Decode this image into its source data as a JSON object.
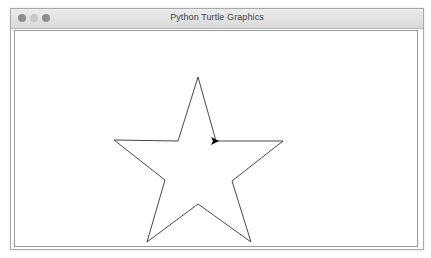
{
  "window": {
    "title": "Python Turtle Graphics",
    "controls": [
      "close",
      "minimize",
      "maximize"
    ]
  },
  "canvas": {
    "background": "#ffffff",
    "shape": "five-pointed star",
    "stroke_color": "#333333",
    "star_points": "198,77 216,141 283,141 232,181 251,242 198,204 147,242 165,180 114,140 178,141",
    "turtle": {
      "icon": "turtle-arrow-icon",
      "x": 216,
      "y": 141,
      "heading": "right",
      "color": "#000000"
    }
  }
}
